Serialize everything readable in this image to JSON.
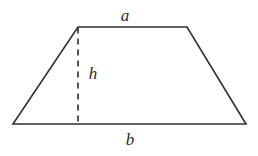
{
  "figure": {
    "type": "trapezoid-diagram",
    "background_color": "#ffffff",
    "stroke_color": "#2f2f2f",
    "stroke_width": 1.6,
    "labels": {
      "top_side": "a",
      "height": "h",
      "bottom_side": "b"
    },
    "geometry": {
      "top_left": [
        78,
        27
      ],
      "top_right": [
        187,
        27
      ],
      "bottom_right": [
        246,
        124
      ],
      "bottom_left": [
        13,
        124
      ],
      "height_line": {
        "from": [
          78,
          27
        ],
        "to": [
          78,
          124
        ],
        "style": "dashed",
        "dash_length": 6,
        "dash_gap": 5
      }
    }
  }
}
